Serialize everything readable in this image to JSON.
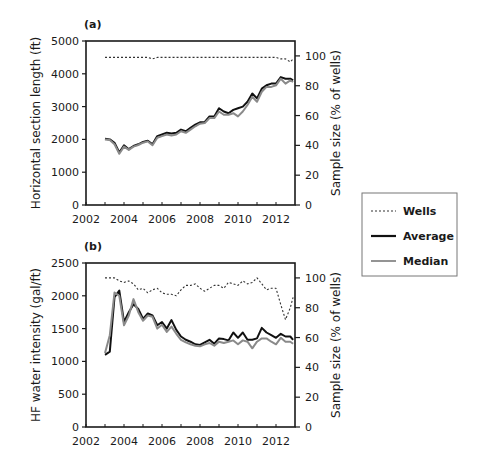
{
  "chart_data": [
    {
      "panel": "(a)",
      "type": "line",
      "title": "",
      "xlabel": "",
      "ylabel": "Horizontal section length (ft)",
      "y2label": "Sample size (% of wells)",
      "xlim": [
        2002,
        2013
      ],
      "ylim": [
        0,
        5000
      ],
      "y2lim": [
        0,
        110
      ],
      "xticks": [
        "2002",
        "2004",
        "2006",
        "2008",
        "2010",
        "2012"
      ],
      "yticks": [
        "0",
        "1000",
        "2000",
        "3000",
        "4000",
        "5000"
      ],
      "y2ticks": [
        "0",
        "20",
        "40",
        "60",
        "80",
        "100"
      ],
      "x": [
        2003.0,
        2003.25,
        2003.5,
        2003.75,
        2004.0,
        2004.25,
        2004.5,
        2004.75,
        2005.0,
        2005.25,
        2005.5,
        2005.75,
        2006.0,
        2006.25,
        2006.5,
        2006.75,
        2007.0,
        2007.25,
        2007.5,
        2007.75,
        2008.0,
        2008.25,
        2008.5,
        2008.75,
        2009.0,
        2009.25,
        2009.5,
        2009.75,
        2010.0,
        2010.25,
        2010.5,
        2010.75,
        2011.0,
        2011.25,
        2011.5,
        2011.75,
        2012.0,
        2012.25,
        2012.5,
        2012.75,
        2012.9
      ],
      "series": [
        {
          "name": "Average",
          "axis": "left",
          "values": [
            2020,
            2000,
            1900,
            1600,
            1820,
            1700,
            1800,
            1850,
            1920,
            1960,
            1850,
            2100,
            2150,
            2200,
            2180,
            2200,
            2300,
            2250,
            2350,
            2450,
            2520,
            2530,
            2700,
            2700,
            2950,
            2850,
            2800,
            2900,
            2950,
            3000,
            3150,
            3400,
            3250,
            3550,
            3650,
            3700,
            3700,
            3900,
            3850,
            3850,
            3800
          ]
        },
        {
          "name": "Median",
          "axis": "left",
          "values": [
            2000,
            1980,
            1850,
            1560,
            1780,
            1680,
            1780,
            1830,
            1900,
            1940,
            1820,
            2050,
            2100,
            2150,
            2120,
            2150,
            2250,
            2200,
            2300,
            2400,
            2480,
            2500,
            2650,
            2650,
            2850,
            2750,
            2750,
            2800,
            2700,
            2850,
            3050,
            3300,
            3150,
            3450,
            3600,
            3600,
            3650,
            3850,
            3700,
            3800,
            3750
          ]
        },
        {
          "name": "Wells",
          "axis": "right",
          "values": [
            99,
            99,
            99,
            99,
            99,
            99,
            99,
            99,
            99,
            99,
            98,
            99,
            99,
            99,
            99,
            99,
            99,
            99,
            99,
            99,
            99,
            99,
            99,
            99,
            99,
            99,
            99,
            99,
            99,
            99,
            99,
            99,
            99,
            99,
            99,
            99,
            99,
            98,
            98,
            96,
            98
          ]
        }
      ]
    },
    {
      "panel": "(b)",
      "type": "line",
      "title": "",
      "xlabel": "",
      "ylabel": "HF water intensity (gal/ft)",
      "y2label": "Sample size (% of wells)",
      "xlim": [
        2002,
        2013
      ],
      "ylim": [
        0,
        2500
      ],
      "y2lim": [
        0,
        110
      ],
      "xticks": [
        "2002",
        "2004",
        "2006",
        "2008",
        "2010",
        "2012"
      ],
      "yticks": [
        "0",
        "500",
        "1000",
        "1500",
        "2000",
        "2500"
      ],
      "y2ticks": [
        "0",
        "20",
        "40",
        "60",
        "80",
        "100"
      ],
      "x": [
        2003.0,
        2003.25,
        2003.5,
        2003.75,
        2004.0,
        2004.25,
        2004.5,
        2004.75,
        2005.0,
        2005.25,
        2005.5,
        2005.75,
        2006.0,
        2006.25,
        2006.5,
        2006.75,
        2007.0,
        2007.25,
        2007.5,
        2007.75,
        2008.0,
        2008.25,
        2008.5,
        2008.75,
        2009.0,
        2009.25,
        2009.5,
        2009.75,
        2010.0,
        2010.25,
        2010.5,
        2010.75,
        2011.0,
        2011.25,
        2011.5,
        2011.75,
        2012.0,
        2012.25,
        2012.5,
        2012.75,
        2012.9
      ],
      "series": [
        {
          "name": "Average",
          "axis": "left",
          "values": [
            1100,
            1150,
            1980,
            2080,
            1600,
            1750,
            1870,
            1800,
            1650,
            1730,
            1700,
            1550,
            1600,
            1500,
            1630,
            1480,
            1380,
            1330,
            1300,
            1260,
            1250,
            1290,
            1330,
            1270,
            1350,
            1340,
            1320,
            1440,
            1360,
            1440,
            1330,
            1330,
            1350,
            1510,
            1440,
            1400,
            1360,
            1420,
            1380,
            1380,
            1330
          ]
        },
        {
          "name": "Median",
          "axis": "left",
          "values": [
            1130,
            1400,
            2050,
            2000,
            1550,
            1700,
            1950,
            1750,
            1620,
            1700,
            1680,
            1500,
            1560,
            1450,
            1530,
            1420,
            1330,
            1290,
            1260,
            1240,
            1230,
            1260,
            1280,
            1240,
            1300,
            1280,
            1300,
            1320,
            1260,
            1320,
            1300,
            1200,
            1300,
            1350,
            1350,
            1300,
            1260,
            1360,
            1300,
            1300,
            1270
          ]
        },
        {
          "name": "Wells",
          "axis": "right",
          "values": [
            100,
            100,
            100,
            98,
            97,
            98,
            96,
            92,
            93,
            90,
            92,
            93,
            90,
            89,
            89,
            88,
            92,
            95,
            95,
            96,
            93,
            91,
            93,
            95,
            95,
            93,
            97,
            96,
            95,
            98,
            96,
            97,
            100,
            96,
            92,
            93,
            93,
            82,
            72,
            80,
            87
          ]
        }
      ]
    }
  ],
  "legend": {
    "position": "right-middle",
    "items": [
      {
        "label": "Wells",
        "style": "dotted",
        "color": "#333333"
      },
      {
        "label": "Average",
        "style": "solid",
        "color": "#111111"
      },
      {
        "label": "Median",
        "style": "solid",
        "color": "#888888"
      }
    ]
  },
  "colors": {
    "average": "#111111",
    "median": "#8a8a8a",
    "wells": "#333333",
    "axis": "#1a1a1a"
  }
}
